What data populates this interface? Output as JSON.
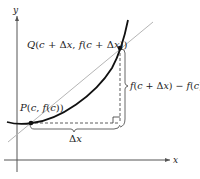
{
  "diagram": {
    "type": "secant-line-diagram",
    "axes": {
      "x_label": "x",
      "y_label": "y"
    },
    "points": {
      "P": {
        "label": "P(c, f(c))"
      },
      "Q": {
        "label": "Q(c + Δx, f(c + Δx))"
      }
    },
    "labels": {
      "dy": "f(c + Δx) − f(c)",
      "dx": "Δx"
    },
    "colors": {
      "curve": "#111111",
      "secant": "#b5b5b5",
      "axes": "#555555",
      "dashed": "#333333",
      "brace": "#555555"
    }
  }
}
